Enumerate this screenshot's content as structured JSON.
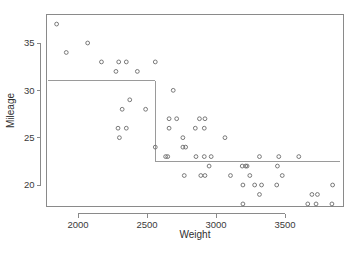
{
  "chart_data": {
    "type": "scatter",
    "title": "",
    "xlabel": "Weight",
    "ylabel": "Mileage",
    "xlim": [
      1780,
      3900
    ],
    "ylim": [
      17.0,
      37.8
    ],
    "grid": false,
    "legend": null,
    "x_ticks": [
      2000,
      2500,
      3000,
      3500
    ],
    "x_tick_labels": [
      "2000",
      "2500",
      "3000",
      "3500"
    ],
    "y_ticks": [
      20,
      25,
      30,
      35
    ],
    "y_tick_labels": [
      "20",
      "25",
      "30",
      "35"
    ],
    "point_marker": "open-circle",
    "point_color": "#6b6b6b",
    "points": [
      [
        1845,
        37
      ],
      [
        2070,
        35
      ],
      [
        1915,
        34
      ],
      [
        2170,
        33
      ],
      [
        2295,
        33
      ],
      [
        2350,
        33
      ],
      [
        2560,
        33
      ],
      [
        2275,
        32
      ],
      [
        2430,
        32
      ],
      [
        2690,
        30
      ],
      [
        2375,
        29
      ],
      [
        2320,
        28
      ],
      [
        2490,
        28
      ],
      [
        2660,
        27
      ],
      [
        2715,
        27
      ],
      [
        2880,
        27
      ],
      [
        2920,
        27
      ],
      [
        2290,
        26
      ],
      [
        2350,
        26
      ],
      [
        2660,
        26
      ],
      [
        2850,
        26
      ],
      [
        2915,
        26
      ],
      [
        2300,
        25
      ],
      [
        2760,
        25
      ],
      [
        3065,
        25
      ],
      [
        2560,
        24
      ],
      [
        2760,
        24
      ],
      [
        2780,
        24
      ],
      [
        2635,
        23
      ],
      [
        2650,
        23
      ],
      [
        2855,
        23
      ],
      [
        2915,
        23
      ],
      [
        2965,
        23
      ],
      [
        3315,
        23
      ],
      [
        3455,
        23
      ],
      [
        3600,
        23
      ],
      [
        2950,
        22
      ],
      [
        3190,
        22
      ],
      [
        3215,
        22
      ],
      [
        3225,
        22
      ],
      [
        3445,
        22
      ],
      [
        2770,
        21
      ],
      [
        2890,
        21
      ],
      [
        2920,
        21
      ],
      [
        3105,
        21
      ],
      [
        3245,
        21
      ],
      [
        3480,
        21
      ],
      [
        3195,
        20
      ],
      [
        3280,
        20
      ],
      [
        3330,
        20
      ],
      [
        3440,
        20
      ],
      [
        3845,
        20
      ],
      [
        3315,
        19
      ],
      [
        3695,
        19
      ],
      [
        3735,
        19
      ],
      [
        3195,
        18
      ],
      [
        3665,
        18
      ],
      [
        3725,
        18
      ],
      [
        3840,
        18
      ]
    ],
    "partition": {
      "description": "regression-tree step boundary",
      "segments": [
        {
          "type": "horizontal",
          "y": 31.0,
          "x_start": 1780,
          "x_end": 2560
        },
        {
          "type": "vertical",
          "x": 2560,
          "y_start": 22.5,
          "y_end": 31.0
        },
        {
          "type": "horizontal",
          "y": 22.5,
          "x_start": 2560,
          "x_end": 3900
        }
      ]
    }
  }
}
